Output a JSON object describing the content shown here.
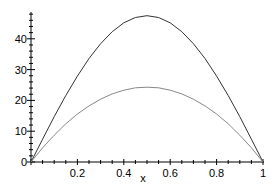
{
  "chart_data": {
    "type": "line",
    "title": "",
    "xlabel": "x",
    "ylabel": "",
    "xlim": [
      0,
      1
    ],
    "ylim": [
      0,
      48
    ],
    "x_ticks": [
      0.2,
      0.4,
      0.6,
      0.8,
      1
    ],
    "x_tick_labels": [
      "0.2",
      "0.4",
      "0.6",
      "0.8",
      "1"
    ],
    "y_ticks": [
      0,
      10,
      20,
      30,
      40
    ],
    "y_tick_labels": [
      "0",
      "10",
      "20",
      "30",
      "40"
    ],
    "grid": false,
    "legend": null,
    "x": [
      0,
      0.05,
      0.1,
      0.15,
      0.2,
      0.25,
      0.3,
      0.35,
      0.4,
      0.45,
      0.5,
      0.55,
      0.6,
      0.65,
      0.7,
      0.75,
      0.8,
      0.85,
      0.9,
      0.95,
      1
    ],
    "series": [
      {
        "name": "upper curve",
        "color": "#333333",
        "values": [
          0,
          7.4,
          14.7,
          21.6,
          27.9,
          33.6,
          38.4,
          42.3,
          45.2,
          46.9,
          47.5,
          46.9,
          45.2,
          42.3,
          38.4,
          33.6,
          27.9,
          21.6,
          14.7,
          7.4,
          0
        ]
      },
      {
        "name": "lower curve",
        "color": "#888888",
        "values": [
          0,
          4.6,
          8.7,
          12.4,
          15.6,
          18.2,
          20.4,
          22.1,
          23.3,
          24.1,
          24.3,
          24.1,
          23.3,
          22.1,
          20.4,
          18.2,
          15.6,
          12.4,
          8.7,
          4.6,
          0
        ]
      }
    ]
  },
  "labels": {
    "x_axis": "x",
    "y_ticks": [
      "0",
      "10",
      "20",
      "30",
      "40"
    ],
    "x_ticks": [
      "0.2",
      "0.4",
      "0.6",
      "0.8",
      "1"
    ]
  }
}
